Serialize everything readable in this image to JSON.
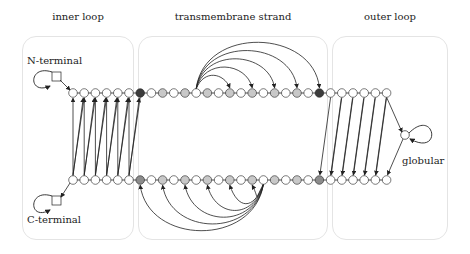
{
  "regions": [
    {
      "title": "inner loop",
      "x": 22,
      "w": 112,
      "title_x": 22
    },
    {
      "title": "transmembrane strand",
      "x": 138,
      "w": 190,
      "title_x": 138
    },
    {
      "title": "outer loop",
      "x": 332,
      "w": 116,
      "title_x": 332
    }
  ],
  "labels": {
    "n_terminal": "N-terminal",
    "c_terminal": "C-terminal",
    "globular": "globular"
  },
  "colors": {
    "white": "#ffffff",
    "light_gray": "#c8c8c8",
    "mid_gray": "#8c8c8c",
    "dark": "#3c3c3c",
    "stroke": "#222222",
    "box_border": "#e4e4e4"
  },
  "rows": {
    "top_y": 93,
    "bottom_y": 180,
    "x_start": 73,
    "spacing": 11.2,
    "top_fills": [
      "w",
      "w",
      "w",
      "w",
      "w",
      "w",
      "d",
      "w",
      "g",
      "w",
      "g",
      "w",
      "g",
      "w",
      "g",
      "w",
      "g",
      "w",
      "g",
      "w",
      "g",
      "w",
      "d",
      "w",
      "w",
      "w",
      "w",
      "w",
      "w"
    ],
    "bottom_fills": [
      "w",
      "w",
      "w",
      "w",
      "w",
      "w",
      "m",
      "w",
      "g",
      "w",
      "g",
      "w",
      "g",
      "w",
      "g",
      "w",
      "g",
      "w",
      "g",
      "w",
      "g",
      "w",
      "m",
      "w",
      "w",
      "w",
      "w",
      "w",
      "w"
    ]
  },
  "top_arcs": {
    "source": 11,
    "targets": [
      14,
      16,
      18,
      20,
      22
    ]
  },
  "bottom_arcs": {
    "source": 17,
    "targets": [
      6,
      8,
      10,
      12,
      14,
      16
    ]
  },
  "inner_loop_links": 6,
  "outer_loop_links": 6
}
